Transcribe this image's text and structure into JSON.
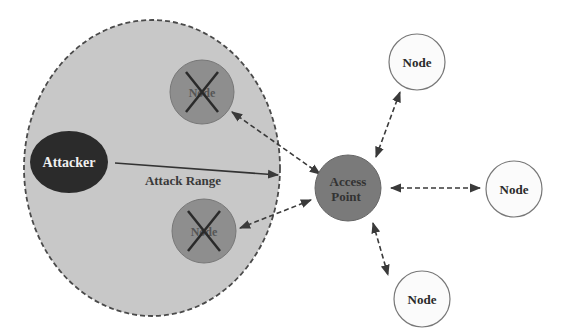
{
  "diagram": {
    "type": "network-attack-diagram",
    "attack_zone": {
      "label": "",
      "fill": "#c8c8c8",
      "stroke": "#444444"
    },
    "attacker": {
      "label": "Attacker",
      "fill": "#2b2b2b",
      "text_color": "#f0f0f0"
    },
    "attack_range": {
      "label": "Attack Range"
    },
    "compromised_nodes": [
      {
        "label": "Node",
        "status": "disabled",
        "fill": "#8e8e8e"
      },
      {
        "label": "Node",
        "status": "disabled",
        "fill": "#8e8e8e"
      }
    ],
    "access_point": {
      "label_line1": "Access",
      "label_line2": "Point",
      "fill": "#7a7a7a"
    },
    "nodes": [
      {
        "label": "Node",
        "position": "top"
      },
      {
        "label": "Node",
        "position": "right"
      },
      {
        "label": "Node",
        "position": "bottom"
      }
    ],
    "links": [
      {
        "from": "access_point",
        "to": "compromised_nodes.0",
        "style": "dashed",
        "direction": "both"
      },
      {
        "from": "access_point",
        "to": "compromised_nodes.1",
        "style": "dashed",
        "direction": "both"
      },
      {
        "from": "access_point",
        "to": "nodes.0",
        "style": "dashed",
        "direction": "both"
      },
      {
        "from": "access_point",
        "to": "nodes.1",
        "style": "dashed",
        "direction": "both"
      },
      {
        "from": "access_point",
        "to": "nodes.2",
        "style": "dashed",
        "direction": "both"
      },
      {
        "from": "attacker",
        "to": "attack_zone_edge",
        "style": "solid",
        "direction": "forward"
      }
    ]
  }
}
